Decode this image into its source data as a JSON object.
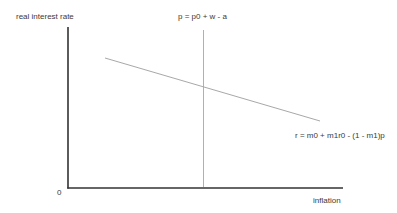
{
  "diagram": {
    "y_axis_label": "real interest rate",
    "x_axis_label": "inflation",
    "origin_label": "0",
    "vertical_line_label": "p = p0 + w - a",
    "sloped_line_label": "r = m0 + m1r0 - (1 - m1)p",
    "colors": {
      "axis": "#333333",
      "vertical_line": "#b0b0b0",
      "sloped_line": "#a8a8a8",
      "text": "#3a3a3a",
      "background": "#ffffff"
    }
  }
}
